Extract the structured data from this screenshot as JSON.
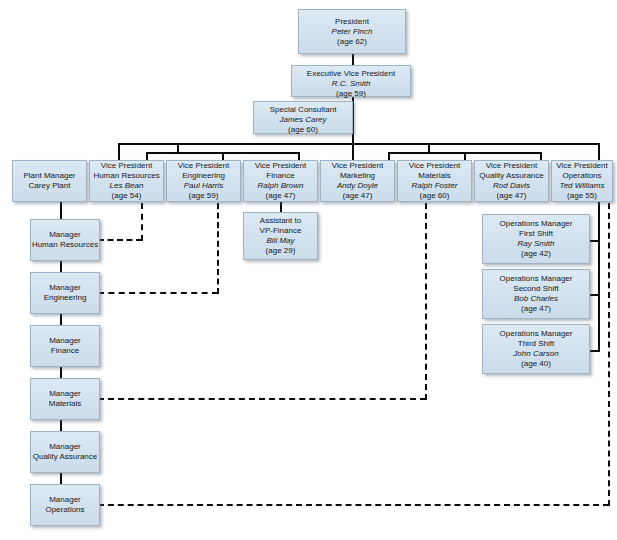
{
  "chart": {
    "box_fill": "#d6e3ef",
    "box_border": "#9fb3c4",
    "line_color": "#0a0a0a",
    "background": "#ffffff"
  },
  "nodes": {
    "president": {
      "title": "President",
      "name": "Peter Finch",
      "age": "(age 62)"
    },
    "exec_vp": {
      "title": "Executive Vice President",
      "name": "R.C. Smith",
      "age": "(age 59)"
    },
    "special_consultant": {
      "title": "Special Consultant",
      "name": "James Carey",
      "age": "(age 60)"
    },
    "plant_manager": {
      "title_line1": "Plant Manager",
      "title_line2": "Carey Plant"
    },
    "vp_hr": {
      "title_line1": "Vice President",
      "title_line2": "Human Resources",
      "name": "Les Bean",
      "age": "(age 54)"
    },
    "vp_engineering": {
      "title_line1": "Vice President",
      "title_line2": "Engineering",
      "name": "Paul Harris",
      "age": "(age 59)"
    },
    "vp_finance": {
      "title_line1": "Vice President",
      "title_line2": "Finance",
      "name": "Ralph Brown",
      "age": "(age 47)"
    },
    "vp_marketing": {
      "title_line1": "Vice President",
      "title_line2": "Marketing",
      "name": "Andy Doyle",
      "age": "(age 47)"
    },
    "vp_materials": {
      "title_line1": "Vice President",
      "title_line2": "Materials",
      "name": "Ralph Foster",
      "age": "(age 60)"
    },
    "vp_quality": {
      "title_line1": "Vice President",
      "title_line2": "Quality Assurance",
      "name": "Rod Davis",
      "age": "(age 47)"
    },
    "vp_operations": {
      "title_line1": "Vice President",
      "title_line2": "Operations",
      "name": "Ted Williams",
      "age": "(age 55)"
    },
    "assistant_finance": {
      "title_line1": "Assistant to",
      "title_line2": "VP-Finance",
      "name": "Bill May",
      "age": "(age 29)"
    },
    "mgr_hr": {
      "title_line1": "Manager",
      "title_line2": "Human Resources"
    },
    "mgr_engineering": {
      "title_line1": "Manager",
      "title_line2": "Engineering"
    },
    "mgr_finance": {
      "title_line1": "Manager",
      "title_line2": "Finance"
    },
    "mgr_materials": {
      "title_line1": "Manager",
      "title_line2": "Materials"
    },
    "mgr_quality": {
      "title_line1": "Manager",
      "title_line2": "Quality Assurance"
    },
    "mgr_operations": {
      "title_line1": "Manager",
      "title_line2": "Operations"
    },
    "ops_first_shift": {
      "title_line1": "Operations Manager",
      "title_line2": "First Shift",
      "name": "Ray Smith",
      "age": "(age 42)"
    },
    "ops_second_shift": {
      "title_line1": "Operations Manager",
      "title_line2": "Second Shift",
      "name": "Bob Charles",
      "age": "(age 47)"
    },
    "ops_third_shift": {
      "title_line1": "Operations Manager",
      "title_line2": "Third Shift",
      "name": "John Carson",
      "age": "(age 40)"
    }
  }
}
